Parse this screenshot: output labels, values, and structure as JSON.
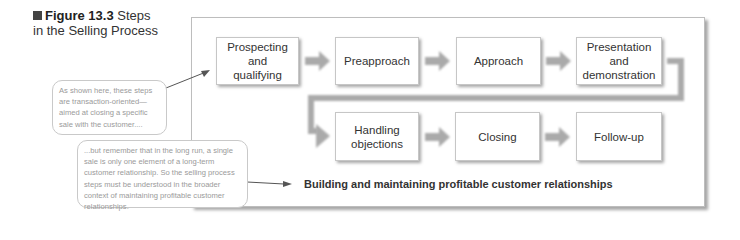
{
  "figure": {
    "label": "Figure 13.3",
    "title_rest": " Steps",
    "title_line2": "in the Selling Process"
  },
  "steps": [
    {
      "label": "Prospecting and qualifying"
    },
    {
      "label": "Preapproach"
    },
    {
      "label": "Approach"
    },
    {
      "label": "Presentation and demonstration"
    },
    {
      "label": "Handling objections"
    },
    {
      "label": "Closing"
    },
    {
      "label": "Follow-up"
    }
  ],
  "callouts": {
    "top": "As shown here, these steps are transaction-oriented—aimed at closing a specific sale with the customer....",
    "bottom": "...but remember that in the long run, a single sale is only one element of a long-term customer relationship. So the selling process steps must be understood in the broader context of maintaining profitable customer relationships."
  },
  "bottom_label": "Building and maintaining profitable customer relationships",
  "colors": {
    "arrow": "#aaaaaa",
    "box_border": "#c6c6c6",
    "callout_text": "#9a9a9a"
  }
}
